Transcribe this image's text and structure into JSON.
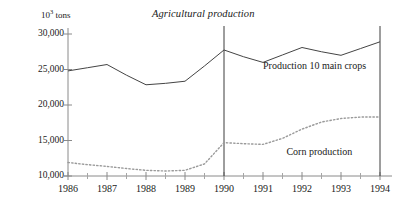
{
  "chart_data": {
    "type": "line",
    "title": "Agricultural production",
    "xlabel": "",
    "ylabel": "10³ tons",
    "ylabel_prefix": "10",
    "ylabel_exponent": "3",
    "ylabel_suffix": " tons",
    "xlim": [
      1986,
      1994
    ],
    "ylim": [
      10000,
      30000
    ],
    "grid": false,
    "legend_position": "inline-annotation",
    "x_tick_labels": [
      "1986",
      "1987",
      "1988",
      "1989",
      "1990",
      "1991",
      "1992",
      "1993",
      "1994"
    ],
    "x_ticks": [
      1986,
      1987,
      1988,
      1989,
      1990,
      1991,
      1992,
      1993,
      1994
    ],
    "x_minor_ticks": [
      1986.5,
      1987.5,
      1988.5,
      1989.5,
      1990.5,
      1991.5,
      1992.5,
      1993.5
    ],
    "y_tick_labels": [
      "10,000",
      "15,000",
      "20,000",
      "25,000",
      "30,000"
    ],
    "y_ticks": [
      10000,
      15000,
      20000,
      25000,
      30000
    ],
    "reference_lines": [
      {
        "x": 1990,
        "label": "1990"
      },
      {
        "x": 1994,
        "label": "1994"
      }
    ],
    "annotations": [
      {
        "text": "Production 10 main crops",
        "x": 1991.0,
        "y": 25400
      },
      {
        "text": "Corn production",
        "x": 1991.6,
        "y": 13300
      }
    ],
    "series": [
      {
        "name": "Production 10 main crops",
        "style": "solid",
        "x": [
          1986,
          1986.5,
          1987,
          1987.5,
          1988,
          1988.5,
          1989,
          1989.5,
          1990,
          1990.5,
          1991,
          1991.5,
          1992,
          1992.5,
          1993,
          1993.5,
          1994
        ],
        "values": [
          24800,
          25250,
          25700,
          24200,
          22850,
          23050,
          23350,
          25500,
          27750,
          26800,
          26000,
          27050,
          28100,
          27500,
          27000,
          27950,
          28900
        ]
      },
      {
        "name": "Corn production",
        "style": "dotted",
        "x": [
          1986,
          1986.5,
          1987,
          1987.5,
          1988,
          1988.5,
          1989,
          1989.5,
          1990,
          1990.5,
          1991,
          1991.5,
          1992,
          1992.5,
          1993,
          1993.5,
          1994
        ],
        "values": [
          11900,
          11600,
          11350,
          11050,
          10800,
          10700,
          10800,
          11700,
          14700,
          14550,
          14450,
          15300,
          16600,
          17600,
          18100,
          18300,
          18300
        ]
      }
    ]
  }
}
